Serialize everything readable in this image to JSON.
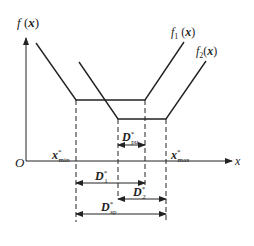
{
  "diagram": {
    "axes": {
      "y_label": "f (x)",
      "x_label": "x",
      "origin_label": "O"
    },
    "curves": [
      {
        "name": "f1",
        "label_main": "f",
        "label_sub": "1",
        "label_arg": "(x)"
      },
      {
        "name": "f2",
        "label_main": "f",
        "label_sub": "2",
        "label_arg": "(x)"
      }
    ],
    "x_markers": [
      {
        "main": "x",
        "sup": "*",
        "sub": "min"
      },
      {
        "main": "x",
        "sup": "*",
        "sub": "max"
      }
    ],
    "dimensions": [
      {
        "main": "D",
        "sup": "*",
        "sub": "pu"
      },
      {
        "main": "D",
        "sup": "*",
        "sub": "1"
      },
      {
        "main": "D",
        "sup": "*",
        "sub": "2"
      },
      {
        "main": "D",
        "sup": "*",
        "sub": "sp"
      }
    ],
    "colors": {
      "line": "#222222",
      "background": "#ffffff"
    }
  }
}
